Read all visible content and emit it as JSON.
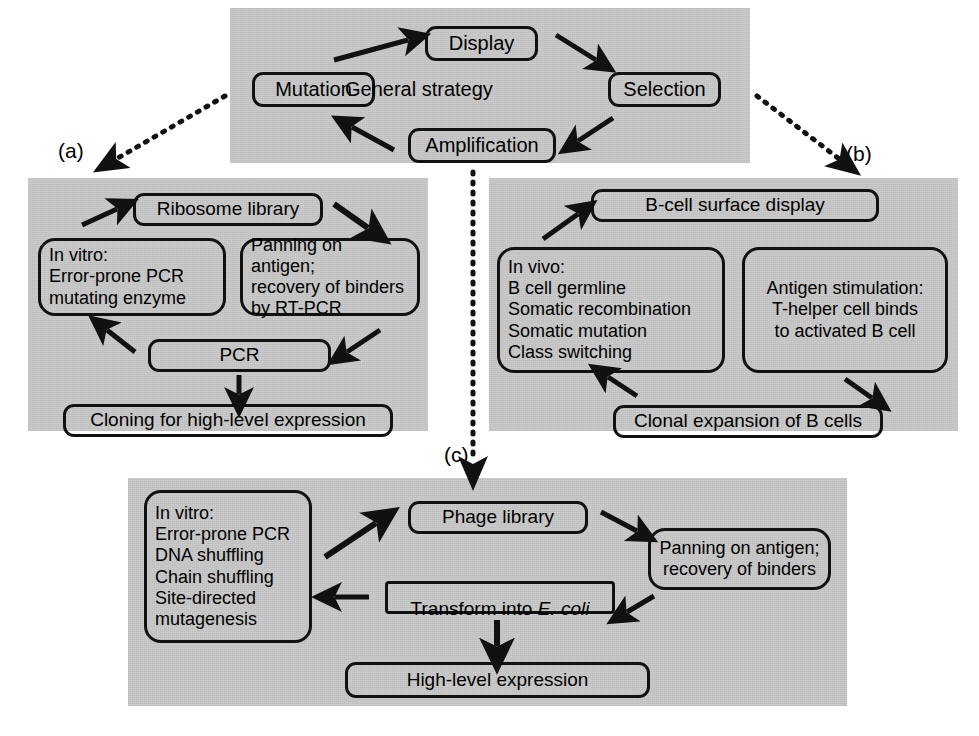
{
  "figure": {
    "background_color": "#ffffff",
    "panel_color": "#c9c9c9",
    "line_color": "#111111"
  },
  "panel_labels": {
    "a": "(a)",
    "b": "(b)",
    "c": "(c)"
  },
  "top_panel": {
    "center_label": "General strategy",
    "nodes": {
      "mutation": "Mutation",
      "display": "Display",
      "selection": "Selection",
      "amplification": "Amplification"
    },
    "cycle_order": [
      "Mutation",
      "Display",
      "Selection",
      "Amplification"
    ]
  },
  "panel_a": {
    "name": "Ribosome display",
    "nodes": {
      "library": "Ribosome library",
      "mutation_box": "In vitro:\nError-prone PCR\nmutating enzyme",
      "selection_box": "Panning on antigen;\nrecovery of binders\nby RT-PCR",
      "amplification": "PCR",
      "output": "Cloning for high-level expression"
    }
  },
  "panel_b": {
    "name": "B-cell in vivo maturation",
    "nodes": {
      "display": "B-cell surface display",
      "mutation_box": "In vivo:\nB cell germline\nSomatic recombination\nSomatic mutation\nClass switching",
      "selection_box": "Antigen stimulation:\nT-helper cell binds\nto activated B cell",
      "amplification": "Clonal expansion of B cells"
    }
  },
  "panel_c": {
    "name": "Phage display",
    "nodes": {
      "mutation_box": "In vitro:\nError-prone PCR\nDNA shuffling\nChain shuffling\nSite-directed\nmutagenesis",
      "library": "Phage library",
      "selection_box": "Panning on antigen;\nrecovery of binders",
      "transform_prefix": "Transform into ",
      "transform_italic": "E. coli",
      "output": "High-level expression"
    }
  }
}
